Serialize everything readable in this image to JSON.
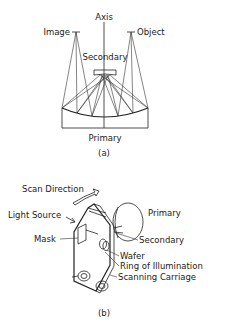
{
  "figure_a": {
    "labels": {
      "axis": "Axis",
      "image": "Image",
      "object": "Object",
      "secondary": "Secondary",
      "primary": "Primary"
    },
    "caption": "(a)"
  },
  "figure_b": {
    "labels": {
      "scan_direction": "Scan Direction",
      "light_source": "Light Source",
      "mask": "Mask",
      "primary": "Primary",
      "secondary": "Secondary",
      "wafer": "Wafer",
      "ring_of_illumination": "Ring of Illumination",
      "scanning_carriage": "Scanning Carriage"
    },
    "caption": "(b)"
  },
  "colors": {
    "ink": "#222222",
    "background": "#ffffff"
  }
}
